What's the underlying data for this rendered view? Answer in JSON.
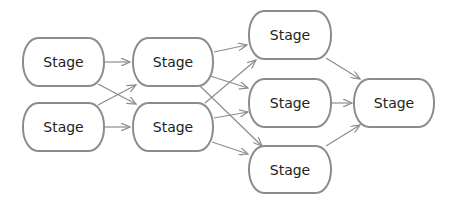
{
  "diagram": {
    "type": "flow",
    "colors": {
      "stroke": "#8c8c8c",
      "text": "#222222",
      "background": "#ffffff"
    },
    "nodes": [
      {
        "id": "n1",
        "label": "Stage",
        "x": 22,
        "y": 37,
        "w": 83,
        "h": 50
      },
      {
        "id": "n2",
        "label": "Stage",
        "x": 22,
        "y": 102,
        "w": 83,
        "h": 50
      },
      {
        "id": "n3",
        "label": "Stage",
        "x": 132,
        "y": 37,
        "w": 82,
        "h": 50
      },
      {
        "id": "n4",
        "label": "Stage",
        "x": 132,
        "y": 102,
        "w": 82,
        "h": 50
      },
      {
        "id": "n5",
        "label": "Stage",
        "x": 248,
        "y": 10,
        "w": 84,
        "h": 50
      },
      {
        "id": "n6",
        "label": "Stage",
        "x": 248,
        "y": 78,
        "w": 84,
        "h": 50
      },
      {
        "id": "n7",
        "label": "Stage",
        "x": 248,
        "y": 145,
        "w": 84,
        "h": 49
      },
      {
        "id": "n8",
        "label": "Stage",
        "x": 353,
        "y": 78,
        "w": 82,
        "h": 50
      }
    ],
    "edges": [
      {
        "from": "n1",
        "to": "n3",
        "points": [
          105,
          62,
          130,
          62
        ]
      },
      {
        "from": "n1",
        "to": "n4",
        "points": [
          98,
          84,
          136,
          104
        ]
      },
      {
        "from": "n2",
        "to": "n3",
        "points": [
          98,
          105,
          136,
          85
        ]
      },
      {
        "from": "n2",
        "to": "n4",
        "points": [
          105,
          127,
          130,
          127
        ]
      },
      {
        "from": "n3",
        "to": "n5",
        "points": [
          214,
          52,
          247,
          45
        ]
      },
      {
        "from": "n3",
        "to": "n6",
        "points": [
          210,
          76,
          248,
          88
        ]
      },
      {
        "from": "n3",
        "to": "n7",
        "points": [
          200,
          86,
          262,
          146
        ]
      },
      {
        "from": "n4",
        "to": "n5",
        "points": [
          205,
          103,
          256,
          60
        ]
      },
      {
        "from": "n4",
        "to": "n6",
        "points": [
          214,
          118,
          248,
          112
        ]
      },
      {
        "from": "n4",
        "to": "n7",
        "points": [
          212,
          142,
          248,
          154
        ]
      },
      {
        "from": "n5",
        "to": "n8",
        "points": [
          326,
          58,
          360,
          79
        ]
      },
      {
        "from": "n6",
        "to": "n8",
        "points": [
          332,
          103,
          352,
          103
        ]
      },
      {
        "from": "n7",
        "to": "n8",
        "points": [
          326,
          146,
          360,
          125
        ]
      }
    ]
  }
}
